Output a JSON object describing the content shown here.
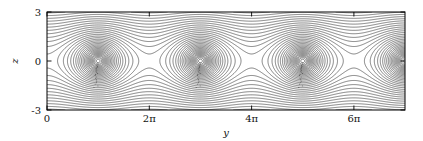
{
  "figure": {
    "title": "",
    "background_color": "#ffffff",
    "width": 423,
    "height": 141
  },
  "chart_data": {
    "type": "line",
    "subtype": "streamline-contour",
    "title": "",
    "subtitle": "",
    "xlabel": "y",
    "ylabel": "z",
    "xlim": [
      0,
      21.9911
    ],
    "ylim": [
      -3,
      3
    ],
    "grid": false,
    "legend": null,
    "line_color": "#1a1a1a",
    "frame_color": "#000000",
    "xticks": [
      0,
      6.2832,
      12.5664,
      18.8496
    ],
    "xticklabels": [
      "0",
      "2π",
      "4π",
      "6π"
    ],
    "xtick_pi_multiples": [
      0,
      2,
      4,
      6
    ],
    "yticks": [
      -3,
      0,
      3
    ],
    "yticklabels": [
      "-3",
      "0",
      "3"
    ],
    "stream_function": "psi = ln(cosh(z) + A*cos(y)) , A = 0.92",
    "vortex_centers_y": [
      3.1416,
      9.4248,
      15.708,
      21.9911
    ],
    "saddle_points_y": [
      0,
      6.2832,
      12.5664,
      18.8496
    ],
    "separatrix_half_height": 1.75,
    "n_contours": 46,
    "contour_levels": [
      -2.45,
      -2.3,
      -2.15,
      -2.0,
      -1.85,
      -1.7,
      -1.55,
      -1.4,
      -1.25,
      -1.1,
      -0.95,
      -0.8,
      -0.65,
      -0.5,
      -0.35,
      -0.2,
      -0.05,
      0.1,
      0.25,
      0.4,
      0.55,
      0.7,
      0.85,
      1.0,
      1.15,
      1.3,
      1.45,
      1.6,
      1.75,
      1.9,
      2.05,
      2.2,
      2.35,
      2.5,
      2.65,
      2.8,
      2.95,
      3.1,
      3.25,
      3.4,
      3.55,
      3.7,
      3.85,
      4.0,
      4.15,
      4.3
    ]
  },
  "axes": {
    "x_axis": {
      "label": "y",
      "tick_labels": [
        "0",
        "2π",
        "4π",
        "6π"
      ]
    },
    "y_axis": {
      "label": "z",
      "tick_labels": [
        "3",
        "0",
        "-3"
      ],
      "tick_top": "3",
      "tick_mid": "0",
      "tick_bottom": "-3"
    }
  }
}
